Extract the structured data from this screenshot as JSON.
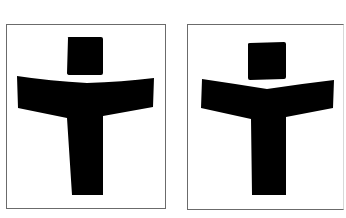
{
  "figure": {
    "colors": {
      "background": "#ffffff",
      "glyph": "#000000",
      "frame_border": "#6b6b6b"
    },
    "panels": [
      {
        "id": "left",
        "label": "Glyph variant A (curved arms, tapering stem)",
        "head": "square-head",
        "arms": "curved-arc-top",
        "stem": "tapered"
      },
      {
        "id": "right",
        "label": "Glyph variant B (V-shaped arms, straight stem)",
        "head": "square-head",
        "arms": "v-shaped-top",
        "stem": "straight"
      }
    ]
  }
}
